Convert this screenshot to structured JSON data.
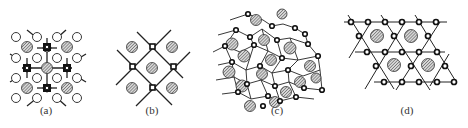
{
  "figure": {
    "panels": [
      {
        "id": "a",
        "label": "(a)",
        "description": "square lattice with open circles, hatched large atoms and dark square sites"
      },
      {
        "id": "b",
        "label": "(b)",
        "description": "square network of bonds with small open square nodes and hatched atoms in cells"
      },
      {
        "id": "c",
        "label": "(c)",
        "description": "disordered network with hatched atoms surrounded by small ring nodes"
      },
      {
        "id": "d",
        "label": "(d)",
        "description": "kagome-like triangular network with ring nodes and hatched atoms in hexagonal cells"
      }
    ]
  },
  "colors": {
    "line": "#222222",
    "hatch": "#555555",
    "background": "#ffffff"
  }
}
